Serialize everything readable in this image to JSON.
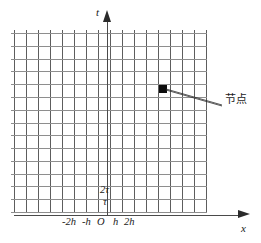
{
  "figure": {
    "title": "",
    "background_color": "#ffffff",
    "grid_line_color_vertical": "#5d5d5d",
    "grid_line_color_horizontal": "#8e8e8e",
    "axis_color": "#4a4a4a",
    "marker_color": "#0d0d0d"
  },
  "axes": {
    "vertical": {
      "label": "t",
      "arrow": "up-arrow-icon"
    },
    "horizontal": {
      "label": "x",
      "arrow": "right-arrow-icon"
    }
  },
  "x_tick_labels": [
    {
      "id": "neg2h",
      "text": "-2h"
    },
    {
      "id": "negh",
      "text": "-h"
    },
    {
      "id": "origin",
      "text": "O"
    },
    {
      "id": "h",
      "text": "h"
    },
    {
      "id": "2h",
      "text": "2h"
    }
  ],
  "y_tick_labels": [
    {
      "id": "2tau",
      "text": "2τ"
    },
    {
      "id": "tau",
      "text": "τ"
    }
  ],
  "annotations": [
    {
      "id": "node",
      "text": "节点",
      "marker": "filled-square-marker",
      "marker_x": 163,
      "marker_y": 89
    }
  ],
  "chart_data": {
    "type": "scatter",
    "title": "",
    "xlabel": "x",
    "ylabel": "t",
    "grid": true,
    "x_tick_values": [
      -2,
      -1,
      0,
      1,
      2
    ],
    "x_tick_text": [
      "-2h",
      "-h",
      "O",
      "h",
      "2h"
    ],
    "y_tick_values": [
      1,
      2
    ],
    "y_tick_text": [
      "τ",
      "2τ"
    ],
    "grid_columns": 16,
    "grid_rows": 14,
    "grid_x_spacing_units": "h",
    "grid_y_spacing_units": "τ",
    "series": [
      {
        "name": "节点",
        "x": [
          4
        ],
        "y": [
          10
        ],
        "marker": "filled-square",
        "label": "节点"
      }
    ],
    "xlim": [
      -8,
      8
    ],
    "ylim": [
      0,
      14
    ],
    "legend": "none",
    "annotations": [
      "节点"
    ]
  }
}
